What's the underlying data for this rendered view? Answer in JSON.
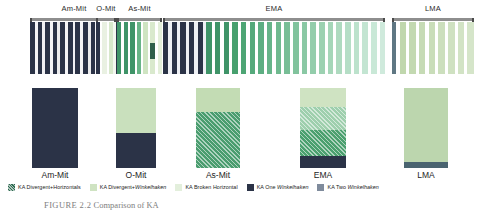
{
  "chart_data": {
    "type": "bar",
    "title": "",
    "xlabel": "",
    "ylabel": "",
    "categories": [
      "Am-Mit",
      "O-Mit",
      "As-Mit",
      "EMA",
      "LMA"
    ],
    "grid": false,
    "legend_position": "bottom",
    "series": [
      {
        "name": "KA Divergent+Horizontals",
        "color": "#2b3347",
        "values": [
          100,
          45,
          0,
          14,
          0
        ]
      },
      {
        "name": "KA Divergent+Winkelhaken",
        "color": "#c9e0bd",
        "values": [
          0,
          55,
          30,
          25,
          0
        ]
      },
      {
        "name": "KA Broken Horizontal",
        "color": "#9ccc9c",
        "values": [
          0,
          0,
          0,
          0,
          92
        ]
      },
      {
        "name": "KA One Winkelhaken",
        "color": "#4a9d6f",
        "values": [
          0,
          0,
          70,
          30,
          0
        ]
      },
      {
        "name": "KA Two Winkelhaken",
        "color": "#7fbd96",
        "values": [
          0,
          0,
          0,
          31,
          8
        ]
      }
    ],
    "bars": [
      {
        "category": "Am-Mit",
        "segments": [
          {
            "label": "KA Divergent+Horizontals",
            "value": 100,
            "color": "#2b3347",
            "pattern": "solid"
          }
        ]
      },
      {
        "category": "O-Mit",
        "segments": [
          {
            "label": "KA Divergent+Winkelhaken",
            "value": 56,
            "color": "#c9e0bd",
            "pattern": "solid"
          },
          {
            "label": "KA Divergent+Horizontals",
            "value": 44,
            "color": "#2b3347",
            "pattern": "solid"
          }
        ]
      },
      {
        "category": "As-Mit",
        "segments": [
          {
            "label": "KA Divergent+Winkelhaken",
            "value": 30,
            "color": "#c3dcb4",
            "pattern": "solid"
          },
          {
            "label": "KA One Winkelhaken",
            "value": 70,
            "color": "#4a9d6f",
            "pattern": "diagonal-hatch"
          }
        ]
      },
      {
        "category": "EMA",
        "segments": [
          {
            "label": "KA Divergent+Winkelhaken",
            "value": 24,
            "color": "#cfe3c2",
            "pattern": "solid"
          },
          {
            "label": "KA Two Winkelhaken",
            "value": 28,
            "color": "#9ecfad",
            "pattern": "diagonal-hatch"
          },
          {
            "label": "KA One Winkelhaken",
            "value": 33,
            "color": "#4ba06f",
            "pattern": "diagonal-hatch"
          },
          {
            "label": "KA Divergent+Horizontals",
            "value": 15,
            "color": "#2b3347",
            "pattern": "solid"
          }
        ]
      },
      {
        "category": "LMA",
        "segments": [
          {
            "label": "KA Broken Horizontal",
            "value": 92,
            "color": "#bcd6ae",
            "pattern": "solid"
          },
          {
            "label": "KA Two Winkelhaken",
            "value": 8,
            "color": "#4a6470",
            "pattern": "solid"
          }
        ]
      }
    ]
  },
  "seriation": {
    "groups": [
      {
        "label": "Am-Mit",
        "x": 30,
        "width": 88,
        "stripes": [
          {
            "color": "#2b3347",
            "w": 5
          },
          {
            "color": "#f4f4f6",
            "w": 3
          },
          {
            "color": "#2b3347",
            "w": 5
          },
          {
            "color": "#f0f0f3",
            "w": 3
          },
          {
            "color": "#2b3347",
            "w": 5
          },
          {
            "color": "#f4f4f6",
            "w": 3
          },
          {
            "color": "#2b3347",
            "w": 5
          },
          {
            "color": "#ececed",
            "w": 3
          },
          {
            "color": "#2b3347",
            "w": 5
          },
          {
            "color": "#f4f4f6",
            "w": 3
          },
          {
            "color": "#2b3347",
            "w": 5
          },
          {
            "color": "#f0f0f3",
            "w": 3
          },
          {
            "color": "#2b3347",
            "w": 5
          },
          {
            "color": "#f4f4f6",
            "w": 3
          },
          {
            "color": "#2b3347",
            "w": 5
          },
          {
            "color": "#ececed",
            "w": 3
          },
          {
            "color": "#2b3347",
            "w": 5
          },
          {
            "color": "#f4f4f6",
            "w": 3
          },
          {
            "color": "#2b3347",
            "w": 5
          },
          {
            "color": "#f0f0f3",
            "w": 3
          },
          {
            "color": "#2b3347",
            "w": 5
          },
          {
            "color": "#f4f4f6",
            "w": 3
          },
          {
            "color": "#2b3347",
            "w": 5
          }
        ]
      },
      {
        "label": "O-Mit",
        "x": 96,
        "width": 20,
        "stripes": [
          {
            "color": "#2b3347",
            "w": 4
          },
          {
            "color": "#ffffff",
            "w": 2
          },
          {
            "color": "#e9f1e2",
            "w": 4
          },
          {
            "color": "#ffffff",
            "w": 2
          },
          {
            "color": "#d7e8cb",
            "w": 4
          },
          {
            "color": "#f3f7ef",
            "w": 3
          }
        ]
      },
      {
        "label": "As-Mit",
        "x": 117,
        "width": 45,
        "stripes": [
          {
            "color": "#3f9468",
            "w": 4
          },
          {
            "color": "#ffffff",
            "w": 2
          },
          {
            "color": "#3f9468",
            "w": 4
          },
          {
            "color": "#ffffff",
            "w": 2
          },
          {
            "color": "#3f9468",
            "w": 4
          },
          {
            "color": "#ffffff",
            "w": 2
          },
          {
            "color": "#68b487",
            "w": 4
          },
          {
            "color": "#ffffff",
            "w": 2
          },
          {
            "color": "#cfe4c2",
            "w": 4
          },
          {
            "color": "#ffffff",
            "w": 2
          },
          {
            "color": "#d9e9cd",
            "w": 5,
            "blip": {
              "color": "#2f5f4a",
              "top": 40,
              "height": 32
            }
          },
          {
            "color": "#ffffff",
            "w": 2
          },
          {
            "color": "#e4efda",
            "w": 4
          }
        ]
      },
      {
        "label": "EMA",
        "x": 163,
        "width": 222,
        "stripes": [
          {
            "color": "#2b3347",
            "w": 5
          },
          {
            "color": "#eef0f4",
            "w": 3
          },
          {
            "color": "#2b3347",
            "w": 5
          },
          {
            "color": "#eef0f4",
            "w": 3
          },
          {
            "color": "#2b3347",
            "w": 5
          },
          {
            "color": "#eef0f4",
            "w": 3
          },
          {
            "color": "#2b3347",
            "w": 5
          },
          {
            "color": "#eef0f4",
            "w": 3
          },
          {
            "color": "#2b3347",
            "w": 5
          },
          {
            "color": "#eef0f4",
            "w": 3
          },
          {
            "color": "#3f9468",
            "w": 5
          },
          {
            "color": "#ffffff",
            "w": 3
          },
          {
            "color": "#3f9468",
            "w": 5
          },
          {
            "color": "#ffffff",
            "w": 3
          },
          {
            "color": "#3f9468",
            "w": 5
          },
          {
            "color": "#ffffff",
            "w": 3
          },
          {
            "color": "#47a06e",
            "w": 5
          },
          {
            "color": "#ffffff",
            "w": 3
          },
          {
            "color": "#4da574",
            "w": 5
          },
          {
            "color": "#ffffff",
            "w": 3
          },
          {
            "color": "#55a97b",
            "w": 5
          },
          {
            "color": "#ffffff",
            "w": 3
          },
          {
            "color": "#5dae82",
            "w": 5
          },
          {
            "color": "#ffffff",
            "w": 3
          },
          {
            "color": "#66b489",
            "w": 5
          },
          {
            "color": "#ffffff",
            "w": 3
          },
          {
            "color": "#6fb98f",
            "w": 5
          },
          {
            "color": "#ffffff",
            "w": 3
          },
          {
            "color": "#78be96",
            "w": 5
          },
          {
            "color": "#ffffff",
            "w": 3
          },
          {
            "color": "#81c39d",
            "w": 5
          },
          {
            "color": "#ffffff",
            "w": 3
          },
          {
            "color": "#8ac8a4",
            "w": 5
          },
          {
            "color": "#ffffff",
            "w": 3
          },
          {
            "color": "#93cdab",
            "w": 5
          },
          {
            "color": "#ffffff",
            "w": 3
          },
          {
            "color": "#9cd1b1",
            "w": 5
          },
          {
            "color": "#ffffff",
            "w": 3
          },
          {
            "color": "#a5d6b8",
            "w": 5
          },
          {
            "color": "#ffffff",
            "w": 3
          },
          {
            "color": "#aedabf",
            "w": 5
          },
          {
            "color": "#ffffff",
            "w": 3
          },
          {
            "color": "#b5dec6",
            "w": 5
          },
          {
            "color": "#ffffff",
            "w": 3
          },
          {
            "color": "#bce2cc",
            "w": 5
          },
          {
            "color": "#ffffff",
            "w": 3
          },
          {
            "color": "#c3e5d2",
            "w": 5
          },
          {
            "color": "#ffffff",
            "w": 3
          },
          {
            "color": "#c9e8d7",
            "w": 5
          },
          {
            "color": "#ffffff",
            "w": 3
          },
          {
            "color": "#cfeadc",
            "w": 5
          }
        ]
      },
      {
        "label": "LMA",
        "x": 392,
        "width": 82,
        "stripes": [
          {
            "color": "#5f7783",
            "w": 4
          },
          {
            "color": "#ffffff",
            "w": 3
          },
          {
            "color": "#c0d7ad",
            "w": 6
          },
          {
            "color": "#ffffff",
            "w": 3
          },
          {
            "color": "#c3d9b1",
            "w": 6
          },
          {
            "color": "#ffffff",
            "w": 3
          },
          {
            "color": "#c6dbb5",
            "w": 6
          },
          {
            "color": "#ffffff",
            "w": 3
          },
          {
            "color": "#c9ddb9",
            "w": 6
          },
          {
            "color": "#ffffff",
            "w": 3
          },
          {
            "color": "#ccdfbd",
            "w": 6
          },
          {
            "color": "#ffffff",
            "w": 3
          },
          {
            "color": "#cfe1c1",
            "w": 6
          },
          {
            "color": "#ffffff",
            "w": 3
          },
          {
            "color": "#d2e3c5",
            "w": 6
          },
          {
            "color": "#ffffff",
            "w": 3
          },
          {
            "color": "#d5e5c9",
            "w": 6
          }
        ]
      }
    ]
  },
  "bar_layout": [
    {
      "category": "Am-Mit",
      "x": 32,
      "width": 46
    },
    {
      "category": "O-Mit",
      "x": 116,
      "width": 40
    },
    {
      "category": "As-Mit",
      "x": 196,
      "width": 44
    },
    {
      "category": "EMA",
      "x": 300,
      "width": 46
    },
    {
      "category": "LMA",
      "x": 404,
      "width": 44
    }
  ],
  "legend": {
    "items": [
      {
        "label": "KA Divergent+Horizontals",
        "plain": "KA Divergent+Horizontals",
        "color": "#2f6b52",
        "pattern": "diagonal-hatch"
      },
      {
        "label": "KA Divergent+Winkelhaken",
        "plain": "KA Divergent+",
        "italic": "Winkelhaken",
        "color": "#cfe3c2",
        "pattern": "solid"
      },
      {
        "label": "KA Broken Horizontal",
        "plain": "KA Broken Horizontal",
        "color": "#e3efdc",
        "pattern": "solid"
      },
      {
        "label": "KA One Winkelhaken",
        "plain": "KA One ",
        "italic": "Winkelhaken",
        "color": "#2b3347",
        "pattern": "solid"
      },
      {
        "label": "KA Two Winkelhaken",
        "plain": "KA Two ",
        "italic": "Winkelhaken",
        "color": "#7f8b9c",
        "pattern": "solid"
      }
    ]
  },
  "caption": {
    "number": "FIGURE 2.2",
    "text": "Comparison of KA"
  }
}
